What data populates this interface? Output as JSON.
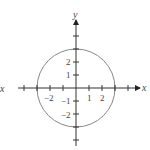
{
  "figure": {
    "type": "circle-on-axes",
    "x_axis_label": "x",
    "y_axis_label": "y",
    "left_edge_label": "x",
    "x_tick_labels": [
      "−2",
      "1",
      "2"
    ],
    "y_tick_labels": [
      "2",
      "1",
      "−1",
      "−2"
    ],
    "circle": {
      "center": [
        0,
        0
      ],
      "radius": 3
    },
    "colors": {
      "axis": "#333333",
      "circle": "#888888",
      "text": "#444444"
    }
  }
}
